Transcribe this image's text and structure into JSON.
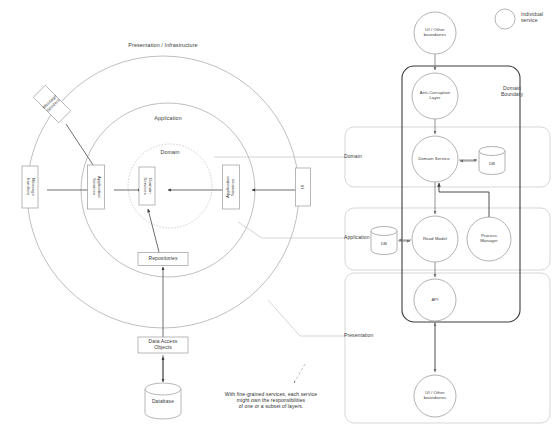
{
  "diagram": {
    "colors": {
      "stroke": "#8c8c8c",
      "stroke_dark": "#3a3a3a",
      "box_fill": "#ffffff",
      "text": "#1a1a1a",
      "faint": "#b5b5b5"
    },
    "left": {
      "name": "onion-layers",
      "rings": [
        {
          "id": "outer",
          "label": "Presentation / Infrastructure",
          "cx": 163,
          "cy": 192,
          "r": 136
        },
        {
          "id": "middle",
          "label": "Application",
          "cx": 168,
          "cy": 190,
          "r": 87
        },
        {
          "id": "inner",
          "label": "Domain",
          "cx": 170,
          "cy": 186,
          "r": 42
        }
      ],
      "boxes": [
        {
          "id": "message-senders",
          "label": "Message\nSenders",
          "x": 52,
          "y": 104,
          "w": 17,
          "h": 36,
          "rotated": true
        },
        {
          "id": "message-handlers",
          "label": "Message\nhandlers",
          "x": 30,
          "y": 187,
          "w": 16,
          "h": 42,
          "vertical": true
        },
        {
          "id": "application-services-left",
          "label": "Application\nServices",
          "x": 96,
          "y": 187,
          "w": 17,
          "h": 44,
          "vertical": true
        },
        {
          "id": "domain-services",
          "label": "Domain\nServices",
          "x": 147,
          "y": 186,
          "w": 16,
          "h": 38,
          "vertical": true
        },
        {
          "id": "application-services-right",
          "label": "Application\nServices",
          "x": 231,
          "y": 187,
          "w": 17,
          "h": 44,
          "vertical": true
        },
        {
          "id": "ui-box",
          "label": "UI",
          "x": 303,
          "y": 187,
          "w": 15,
          "h": 38,
          "vertical": true
        },
        {
          "id": "repositories",
          "label": "Repositories",
          "x": 163,
          "y": 259,
          "w": 50,
          "h": 13
        },
        {
          "id": "data-access-objects",
          "label": "Data Access\nObjects",
          "x": 163,
          "y": 345,
          "w": 50,
          "h": 16
        },
        {
          "id": "database",
          "label": "Database",
          "x": 163,
          "y": 400,
          "w": 36,
          "h": 30,
          "shape": "cylinder"
        }
      ]
    },
    "right": {
      "name": "service-layer-ownership",
      "legend": {
        "label": "Individual\nservice",
        "cx": 505,
        "cy": 19,
        "r": 10
      },
      "domain_boundary_label": "Domain\nBoundary",
      "lane_labels": [
        {
          "id": "lane-domain",
          "label": "Domain",
          "x": 341,
          "y": 157
        },
        {
          "id": "lane-application",
          "label": "Application",
          "x": 341,
          "y": 238
        },
        {
          "id": "lane-presentation",
          "label": "Presentation",
          "x": 341,
          "y": 336
        }
      ],
      "nodes": [
        {
          "id": "ui-other-top",
          "label": "UI / Other\nboundaries",
          "cx": 435,
          "cy": 33,
          "r": 21,
          "shape": "circle"
        },
        {
          "id": "anti-corruption-layer",
          "label": "Anti-Corruption\nLayer",
          "cx": 435,
          "cy": 96,
          "r": 23,
          "shape": "circle"
        },
        {
          "id": "domain-service",
          "label": "Domain Service",
          "cx": 435,
          "cy": 159,
          "r": 23,
          "shape": "circle"
        },
        {
          "id": "domain-db",
          "label": "DB",
          "cx": 492,
          "cy": 161,
          "r": 13,
          "shape": "cylinder"
        },
        {
          "id": "read-model",
          "label": "Read Model",
          "cx": 435,
          "cy": 239,
          "r": 23,
          "shape": "circle"
        },
        {
          "id": "application-db",
          "label": "DB",
          "cx": 384,
          "cy": 241,
          "r": 13,
          "shape": "cylinder"
        },
        {
          "id": "process-manager",
          "label": "Process\nManager",
          "cx": 489,
          "cy": 239,
          "r": 22,
          "shape": "circle"
        },
        {
          "id": "api",
          "label": "API",
          "cx": 435,
          "cy": 300,
          "r": 21,
          "shape": "circle"
        },
        {
          "id": "ui-other-bottom",
          "label": "UI / Other\nboundaries",
          "cx": 435,
          "cy": 396,
          "r": 21,
          "shape": "circle"
        }
      ]
    },
    "caption": "With fine-grained services, each service\nmight own the responsibilities\nof one or a subset of layers."
  }
}
